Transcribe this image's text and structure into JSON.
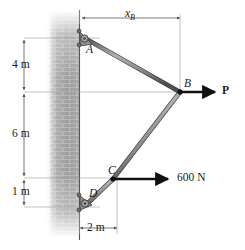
{
  "figure": {
    "background_color": "#ffffff",
    "member_color": "#8c8c8c",
    "member_edge_color": "#4a4a4a",
    "dimension_color": "#6b6b6b",
    "force_color": "#111111",
    "wall_color": "#9a9a9a"
  },
  "dimensions": [
    {
      "id": "x_B",
      "label": "x",
      "subscript": "B",
      "orientation": "horizontal",
      "position": "top"
    },
    {
      "id": "d4m",
      "label": "4 m",
      "subscript": "",
      "orientation": "vertical",
      "position": "left"
    },
    {
      "id": "d6m",
      "label": "6 m",
      "subscript": "",
      "orientation": "vertical",
      "position": "left"
    },
    {
      "id": "d1m",
      "label": "1 m",
      "subscript": "",
      "orientation": "vertical",
      "position": "left"
    },
    {
      "id": "d2m",
      "label": "2 m",
      "subscript": "",
      "orientation": "horizontal",
      "position": "bottom"
    }
  ],
  "points": [
    {
      "id": "A",
      "label": "A",
      "support": "pin"
    },
    {
      "id": "B",
      "label": "B",
      "support": "none"
    },
    {
      "id": "C",
      "label": "C",
      "support": "none"
    },
    {
      "id": "D",
      "label": "D",
      "support": "pin"
    }
  ],
  "forces": [
    {
      "id": "P",
      "label": "P",
      "at": "B",
      "direction": "right",
      "bold": true,
      "magnitude_text": "P"
    },
    {
      "id": "F600N",
      "label": "600 N",
      "at": "C",
      "direction": "right",
      "bold": false,
      "magnitude_text": "600 N"
    }
  ],
  "labels": {
    "x_b": "x",
    "x_b_sub": "B",
    "four_m": "4 m",
    "six_m": "6 m",
    "one_m": "1 m",
    "two_m": "2 m",
    "point_a": "A",
    "point_b": "B",
    "point_c": "C",
    "point_d": "D",
    "force_p": "P",
    "force_600n": "600 N"
  }
}
